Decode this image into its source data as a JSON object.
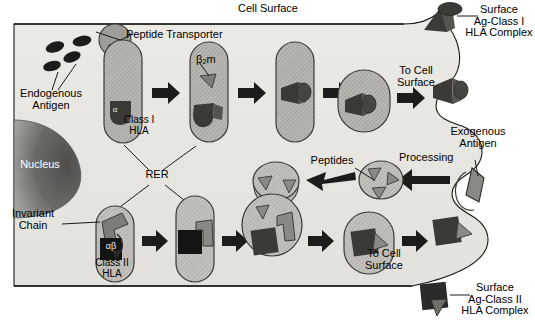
{
  "figure": {
    "type": "biological-pathway-diagram",
    "background_color": "#ffffff",
    "cytoplasm_color": "#e8e7e2",
    "vesicle_color": "#b9b8b2",
    "nucleus_color": "#6e6d6b",
    "outline_color": "#1a1a1a",
    "peptide_color": "#8a8a84",
    "dark_fill": "#2b2b2b"
  },
  "labels": {
    "cell_surface": "Cell Surface",
    "peptide_transporter": "Peptide Transporter",
    "endogenous_antigen": "Endogenous\nAntigen",
    "beta2m": "β₂m",
    "class_i_hla": "Class I\nHLA",
    "alpha": "α",
    "nucleus": "Nucleus",
    "rer": "RER",
    "invariant_chain": "Invariant\nChain",
    "alpha_beta": "αβ",
    "class_ii_hla": "Class II\nHLA",
    "to_cell_surface_top": "To Cell\nSurface",
    "to_cell_surface_bottom": "To Cell\nSurface",
    "peptides": "Peptides",
    "processing": "Processing",
    "exogenous_antigen": "Exogenous\nAntigen",
    "surface_ag_class_i": "Surface\nAg-Class I\nHLA Complex",
    "surface_ag_class_ii": "Surface\nAg-Class II\nHLA Complex"
  },
  "pathways": {
    "class_i": {
      "name": "Class I HLA pathway (endogenous antigen)",
      "steps": [
        "Endogenous antigen",
        "Peptide Transporter into RER",
        "Class I HLA alpha chain in RER",
        "Beta-2 microglobulin association",
        "Peptide loading",
        "Transport vesicle",
        "To Cell Surface",
        "Surface Ag-Class I HLA Complex"
      ],
      "vesicle_count": 5,
      "arrow_count": 4
    },
    "class_ii": {
      "name": "Class II HLA pathway (exogenous antigen)",
      "steps": [
        "Class II HLA alpha-beta with Invariant Chain in RER",
        "Transport vesicle",
        "Transport vesicle",
        "Fusion with endosome containing peptides",
        "Peptide-loaded vesicle",
        "To Cell Surface",
        "Surface Ag-Class II HLA Complex"
      ],
      "vesicle_count": 5,
      "arrow_count": 4
    },
    "exogenous": {
      "name": "Exogenous antigen uptake and processing",
      "steps": [
        "Exogenous Antigen endocytosis",
        "Processing",
        "Peptides in endosome"
      ],
      "arrow_count": 2
    }
  }
}
